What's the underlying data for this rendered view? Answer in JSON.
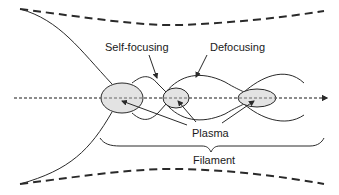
{
  "diagram": {
    "labels": {
      "self_focusing": "Self-focusing",
      "defocusing": "Defocusing",
      "plasma": "Plasma",
      "filament": "Filament"
    },
    "colors": {
      "line": "#2a2a2a",
      "plasma_fill": "#e3e3e3",
      "axis_dash": "#555555",
      "background": "#ffffff"
    },
    "elements": {
      "plasma_regions": 3,
      "beam_envelope": "dashed",
      "propagation_axis": "dashed-arrow"
    }
  }
}
